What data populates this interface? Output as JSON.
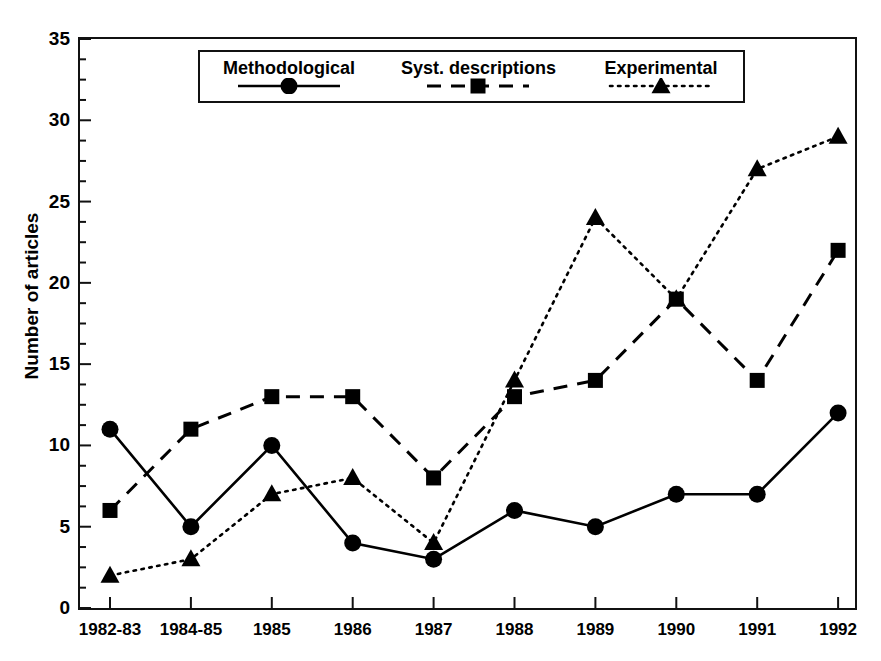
{
  "chart_data": {
    "type": "line",
    "title": "",
    "xlabel": "",
    "ylabel": "Number of articles",
    "categories": [
      "1982-83",
      "1984-85",
      "1985",
      "1986",
      "1987",
      "1988",
      "1989",
      "1990",
      "1991",
      "1992"
    ],
    "ylim": [
      0,
      35
    ],
    "ytick_labels": [
      "0",
      "5",
      "10",
      "15",
      "20",
      "25",
      "30",
      "35"
    ],
    "ytick_values": [
      0,
      5,
      10,
      15,
      20,
      25,
      30,
      35
    ],
    "yminor_step": 1.25,
    "grid": false,
    "legend_position": "top-center-inside",
    "series": [
      {
        "name": "Methodological",
        "marker": "circle",
        "linestyle": "solid",
        "color": "#000000",
        "values": [
          11,
          5,
          10,
          4,
          3,
          6,
          5,
          7,
          7,
          12
        ]
      },
      {
        "name": "Syst. descriptions",
        "marker": "square",
        "linestyle": "dashed",
        "color": "#000000",
        "values": [
          6,
          11,
          13,
          13,
          8,
          13,
          14,
          19,
          14,
          22
        ]
      },
      {
        "name": "Experimental",
        "marker": "triangle",
        "linestyle": "dotted",
        "color": "#000000",
        "values": [
          2,
          3,
          7,
          8,
          4,
          14,
          24,
          19,
          27,
          29
        ]
      }
    ]
  }
}
